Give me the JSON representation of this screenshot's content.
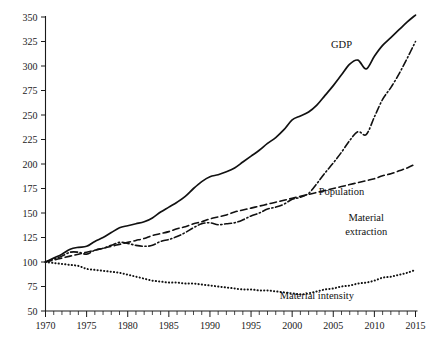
{
  "chart_data": {
    "type": "line",
    "title": "",
    "subtitle": "",
    "xlabel": "",
    "ylabel": "",
    "xlim": [
      1970,
      2015
    ],
    "ylim": [
      50,
      350
    ],
    "ytick_step": 25,
    "xtick_step": 5,
    "x_minor_tick_step": 1,
    "grid": false,
    "legend_position": "inline-annotations",
    "index_base": "1970 = 100",
    "yticks": [
      50,
      75,
      100,
      125,
      150,
      175,
      200,
      225,
      250,
      275,
      300,
      325,
      350
    ],
    "xticks": [
      1970,
      1975,
      1980,
      1985,
      1990,
      1995,
      2000,
      2005,
      2010,
      2015
    ],
    "x": [
      1970,
      1971,
      1972,
      1973,
      1974,
      1975,
      1976,
      1977,
      1978,
      1979,
      1980,
      1981,
      1982,
      1983,
      1984,
      1985,
      1986,
      1987,
      1988,
      1989,
      1990,
      1991,
      1992,
      1993,
      1994,
      1995,
      1996,
      1997,
      1998,
      1999,
      2000,
      2001,
      2002,
      2003,
      2004,
      2005,
      2006,
      2007,
      2008,
      2009,
      2010,
      2011,
      2012,
      2013,
      2014,
      2015
    ],
    "series": [
      {
        "name": "GDP",
        "style": "solid",
        "label": "GDP",
        "values": [
          100,
          104,
          108,
          113,
          115,
          116,
          121,
          125,
          130,
          135,
          137,
          139,
          141,
          145,
          151,
          156,
          161,
          167,
          175,
          182,
          187,
          189,
          192,
          196,
          202,
          208,
          214,
          221,
          227,
          235,
          245,
          249,
          253,
          260,
          270,
          280,
          291,
          302,
          306,
          297,
          310,
          321,
          329,
          337,
          345,
          352
        ]
      },
      {
        "name": "Material extraction",
        "style": "dash-dot",
        "label": "Material extraction",
        "values": [
          100,
          103,
          106,
          110,
          110,
          108,
          112,
          114,
          117,
          120,
          119,
          117,
          116,
          117,
          121,
          123,
          126,
          130,
          135,
          139,
          140,
          138,
          139,
          140,
          143,
          147,
          150,
          154,
          156,
          159,
          164,
          166,
          170,
          180,
          191,
          201,
          212,
          224,
          233,
          230,
          248,
          266,
          278,
          292,
          308,
          325
        ]
      },
      {
        "name": "Population",
        "style": "dashed",
        "label": "Population",
        "values": [
          100,
          102,
          104,
          106,
          108,
          110,
          112,
          114,
          116,
          118,
          120,
          122,
          124,
          127,
          129,
          131,
          134,
          136,
          139,
          141,
          144,
          146,
          148,
          151,
          153,
          155,
          157,
          159,
          161,
          163,
          165,
          167,
          169,
          171,
          173,
          175,
          177,
          179,
          181,
          183,
          185,
          188,
          190,
          193,
          196,
          200
        ]
      },
      {
        "name": "Material intensity",
        "style": "dotted",
        "label": "Material intensity",
        "values": [
          100,
          99,
          98,
          97,
          96,
          93,
          92,
          91,
          90,
          89,
          87,
          85,
          83,
          81,
          80,
          79,
          79,
          78,
          78,
          77,
          76,
          75,
          74,
          73,
          72,
          72,
          71,
          71,
          70,
          69,
          68,
          67,
          68,
          70,
          72,
          73,
          75,
          76,
          78,
          79,
          81,
          84,
          85,
          87,
          89,
          92
        ]
      }
    ],
    "annotations": [
      {
        "text": "GDP",
        "x": 2006,
        "y": 318
      },
      {
        "text": "Material",
        "x": 2009,
        "y": 142
      },
      {
        "text": "extraction",
        "x": 2009,
        "y": 128
      },
      {
        "text": "Population",
        "x": 2006,
        "y": 168
      },
      {
        "text": "Material intensity",
        "x": 2003,
        "y": 62
      }
    ]
  }
}
